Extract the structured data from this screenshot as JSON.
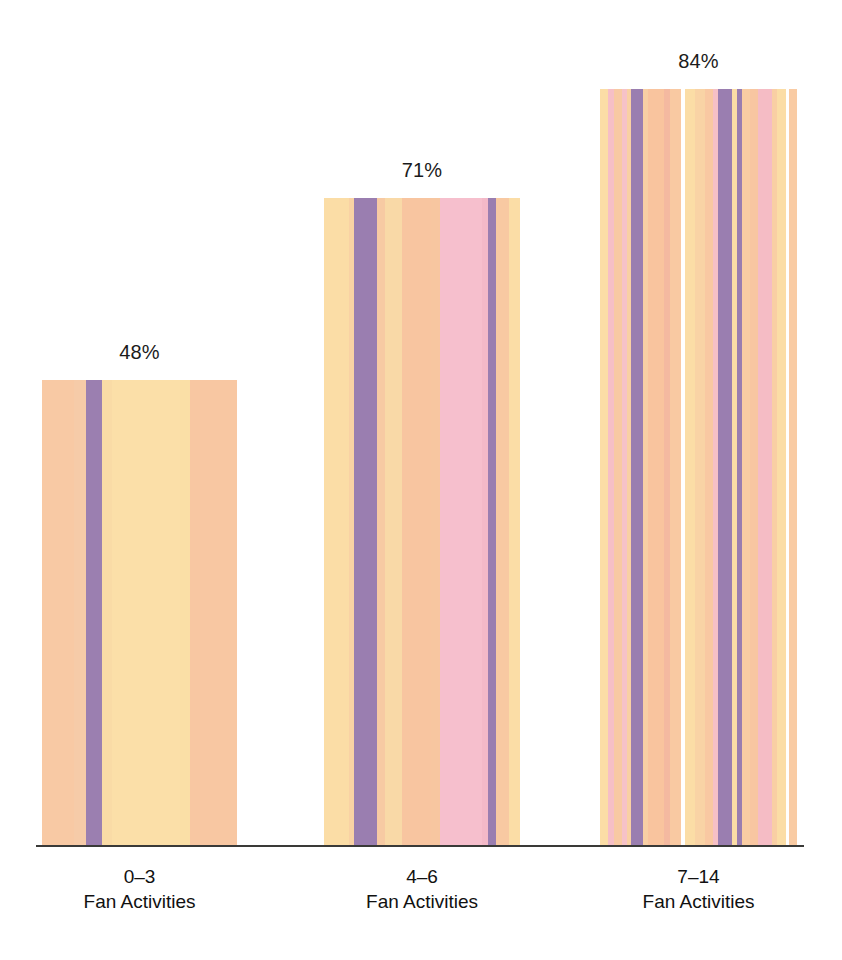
{
  "chart_data": {
    "type": "bar",
    "title": "",
    "subtitle": "",
    "xlabel": "",
    "ylabel": "",
    "grid": false,
    "legend": false,
    "ylim": [
      0,
      100
    ],
    "categories": [
      "0–3",
      "4–6",
      "7–14"
    ],
    "category_sublabels": [
      "Fan Activities",
      "Fan Activities",
      "Fan Activities"
    ],
    "values": [
      48,
      71,
      84
    ],
    "value_labels": [
      "48%",
      "71%",
      "84%"
    ],
    "units": "%"
  },
  "axis": {
    "baseline_color": "#3a3a38"
  },
  "bars": [
    {
      "name": "bar-0-3",
      "value_label": "48%",
      "left": 42,
      "width": 195,
      "height": 466,
      "stripes": [
        {
          "color": "#f8c9a4",
          "w": 32
        },
        {
          "color": "#f6cba8",
          "w": 12
        },
        {
          "color": "#9b7fb0",
          "w": 16
        },
        {
          "color": "#f9dba6",
          "w": 10
        },
        {
          "color": "#fbdfa8",
          "w": 68
        },
        {
          "color": "#fadfa6",
          "w": 10
        },
        {
          "color": "#f8c7a2",
          "w": 47
        }
      ]
    },
    {
      "name": "bar-4-6",
      "value_label": "71%",
      "left": 324,
      "width": 196,
      "height": 648,
      "stripes": [
        {
          "color": "#fbdda6",
          "w": 26
        },
        {
          "color": "#f9d2a4",
          "w": 6
        },
        {
          "color": "#9a7eb0",
          "w": 24
        },
        {
          "color": "#f7caa3",
          "w": 8
        },
        {
          "color": "#f9d9a7",
          "w": 18
        },
        {
          "color": "#f8c5a0",
          "w": 30
        },
        {
          "color": "#f7c6a0",
          "w": 10
        },
        {
          "color": "#f6bfcd",
          "w": 44
        },
        {
          "color": "#f3b9c8",
          "w": 6
        },
        {
          "color": "#9a7eb0",
          "w": 9
        },
        {
          "color": "#f8c9a2",
          "w": 13
        },
        {
          "color": "#fbdda6",
          "w": 12
        }
      ]
    },
    {
      "name": "bar-7-14",
      "value_label": "84%",
      "left": 600,
      "width": 197,
      "height": 757,
      "stripes": [
        {
          "color": "#fbdda6",
          "w": 8
        },
        {
          "color": "#f6bfc6",
          "w": 6
        },
        {
          "color": "#f8c9a3",
          "w": 9
        },
        {
          "color": "#f6c2c8",
          "w": 5
        },
        {
          "color": "#f9d0a4",
          "w": 4
        },
        {
          "color": "#9a7eb0",
          "w": 12
        },
        {
          "color": "#f8cfa4",
          "w": 6
        },
        {
          "color": "#f9c49e",
          "w": 16
        },
        {
          "color": "#f4b9a0",
          "w": 6
        },
        {
          "color": "#f9c9a2",
          "w": 12
        },
        {
          "color": "#ffffff",
          "w": 4
        },
        {
          "color": "#fbdda6",
          "w": 10
        },
        {
          "color": "#f9d3a5",
          "w": 10
        },
        {
          "color": "#f9c8a2",
          "w": 9
        },
        {
          "color": "#f6c0c6",
          "w": 5
        },
        {
          "color": "#9a7eb0",
          "w": 14
        },
        {
          "color": "#fbdda6",
          "w": 5
        },
        {
          "color": "#9a7eb0",
          "w": 5
        },
        {
          "color": "#f9cda3",
          "w": 9
        },
        {
          "color": "#f8c6a1",
          "w": 8
        },
        {
          "color": "#f5bcc5",
          "w": 14
        },
        {
          "color": "#f9cfa4",
          "w": 6
        },
        {
          "color": "#fbdda6",
          "w": 9
        },
        {
          "color": "#ffffff",
          "w": 3
        },
        {
          "color": "#f9cba3",
          "w": 8
        }
      ]
    }
  ],
  "value_label_positions": [
    {
      "left": 42,
      "width": 195,
      "top": 341
    },
    {
      "left": 324,
      "width": 196,
      "top": 159
    },
    {
      "left": 600,
      "width": 197,
      "top": 50
    }
  ],
  "category_label_positions": [
    {
      "left": 42,
      "width": 195
    },
    {
      "left": 324,
      "width": 196
    },
    {
      "left": 600,
      "width": 197
    }
  ],
  "colors": {
    "peach": "#f8c9a4",
    "light_yellow": "#fbdfa8",
    "purple": "#9a7eb0",
    "pink": "#f6bfcd",
    "background": "#ffffff",
    "text": "#111111"
  }
}
